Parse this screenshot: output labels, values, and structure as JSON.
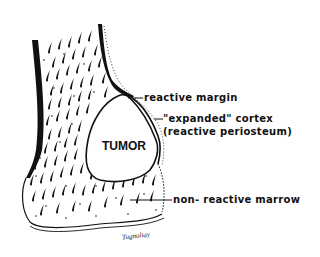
{
  "diagram": {
    "center_label": "TUMOR",
    "labels": [
      {
        "id": "reactive-margin",
        "text": "reactive margin"
      },
      {
        "id": "expanded-cortex",
        "text": "\"expanded\" cortex"
      },
      {
        "id": "reactive-periosteum",
        "text": "(reactive periosteum)"
      },
      {
        "id": "non-reactive-marrow",
        "text": "non- reactive marrow"
      }
    ],
    "signature": "Tugnoliay",
    "colors": {
      "ink": "#111111",
      "background": "#ffffff"
    }
  }
}
